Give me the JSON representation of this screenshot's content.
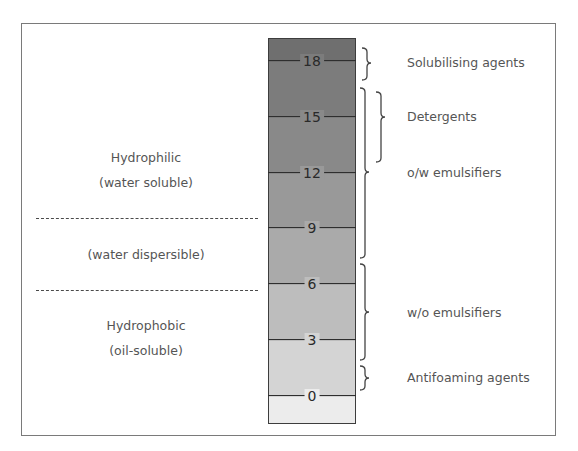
{
  "diagram": {
    "type": "HLB scale",
    "left_regions": {
      "hydrophilic": {
        "line1": "Hydrophilic",
        "line2": "(water soluble)"
      },
      "dispersible": {
        "line1": "(water dispersible)"
      },
      "hydrophobic": {
        "line1": "Hydrophobic",
        "line2": "(oil-soluble)"
      }
    },
    "scale": {
      "ticks": [
        "18",
        "15",
        "12",
        "9",
        "6",
        "3",
        "0"
      ],
      "band_colors": [
        "#6f6f6f",
        "#7c7c7c",
        "#898989",
        "#999999",
        "#aaaaaa",
        "#bdbdbd",
        "#d4d4d4",
        "#ececec"
      ]
    },
    "applications": [
      {
        "label": "Solubilising agents",
        "range": [
          16,
          19
        ]
      },
      {
        "label": "Detergents",
        "range": [
          12.5,
          16.5
        ]
      },
      {
        "label": "o/w emulsifiers",
        "range": [
          7,
          16.5
        ]
      },
      {
        "label": "w/o emulsifiers",
        "range": [
          1.5,
          6.5
        ]
      },
      {
        "label": "Antifoaming agents",
        "range": [
          0.5,
          1.5
        ]
      }
    ]
  }
}
